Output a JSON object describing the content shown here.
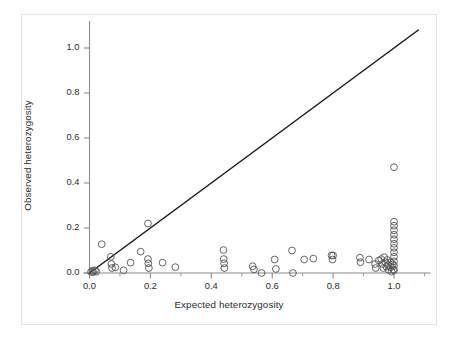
{
  "chart_data": {
    "type": "scatter",
    "title": "",
    "xlabel": "Expected heterozygosity",
    "ylabel": "Observed heterozygosity",
    "xlim": [
      -0.04,
      1.12
    ],
    "ylim": [
      -0.035,
      1.12
    ],
    "xticks": [
      0.0,
      0.2,
      0.4,
      0.6,
      0.8,
      1.0
    ],
    "xticklabels": [
      "0.0",
      "0.2",
      "0.4",
      "0.6",
      "0.8",
      "1.0"
    ],
    "yticks": [
      0.0,
      0.2,
      0.4,
      0.6,
      0.8,
      1.0
    ],
    "yticklabels": [
      "0.0",
      "0.2",
      "0.4",
      "0.6",
      "0.8",
      "1.0"
    ],
    "minor_xticks": [
      0.1,
      0.3,
      0.5,
      0.7,
      0.9,
      1.1
    ],
    "grid": false,
    "legend": null,
    "marker": {
      "shape": "open-circle",
      "radius": 3.4,
      "edge_color": "#555555",
      "face_color": "none",
      "edge_width": 0.9
    },
    "reference_line": {
      "label": "y = x identity line",
      "x0": 0.0,
      "y0": 0.0,
      "x1": 1.08,
      "y1": 1.08,
      "color": "#1a1a1a",
      "width": 1.5
    },
    "axis_color": "#8c8c8c",
    "series": [
      {
        "name": "loci",
        "points": [
          [
            0.005,
            0.005
          ],
          [
            0.01,
            0.01
          ],
          [
            0.012,
            0.004
          ],
          [
            0.018,
            0.012
          ],
          [
            0.022,
            0.006
          ],
          [
            0.04,
            0.128
          ],
          [
            0.07,
            0.072
          ],
          [
            0.072,
            0.04
          ],
          [
            0.074,
            0.022
          ],
          [
            0.085,
            0.025
          ],
          [
            0.112,
            0.012
          ],
          [
            0.135,
            0.046
          ],
          [
            0.168,
            0.095
          ],
          [
            0.192,
            0.22
          ],
          [
            0.192,
            0.062
          ],
          [
            0.193,
            0.043
          ],
          [
            0.195,
            0.022
          ],
          [
            0.24,
            0.046
          ],
          [
            0.282,
            0.026
          ],
          [
            0.44,
            0.102
          ],
          [
            0.441,
            0.062
          ],
          [
            0.442,
            0.043
          ],
          [
            0.443,
            0.022
          ],
          [
            0.536,
            0.03
          ],
          [
            0.54,
            0.016
          ],
          [
            0.565,
            0.0
          ],
          [
            0.608,
            0.06
          ],
          [
            0.612,
            0.018
          ],
          [
            0.665,
            0.1
          ],
          [
            0.668,
            0.0
          ],
          [
            0.705,
            0.06
          ],
          [
            0.735,
            0.064
          ],
          [
            0.795,
            0.078
          ],
          [
            0.798,
            0.06
          ],
          [
            0.8,
            0.078
          ],
          [
            0.888,
            0.068
          ],
          [
            0.89,
            0.048
          ],
          [
            0.918,
            0.06
          ],
          [
            0.938,
            0.04
          ],
          [
            0.94,
            0.022
          ],
          [
            0.95,
            0.055
          ],
          [
            0.958,
            0.062
          ],
          [
            0.962,
            0.04
          ],
          [
            0.965,
            0.022
          ],
          [
            0.968,
            0.07
          ],
          [
            0.972,
            0.048
          ],
          [
            0.975,
            0.028
          ],
          [
            0.978,
            0.058
          ],
          [
            0.98,
            0.036
          ],
          [
            0.982,
            0.014
          ],
          [
            0.988,
            0.048
          ],
          [
            0.99,
            0.026
          ],
          [
            0.992,
            0.006
          ],
          [
            0.996,
            0.038
          ],
          [
            0.998,
            0.016
          ],
          [
            1.0,
            0.47
          ],
          [
            1.0,
            0.228
          ],
          [
            1.0,
            0.21
          ],
          [
            1.0,
            0.19
          ],
          [
            1.0,
            0.17
          ],
          [
            1.0,
            0.15
          ],
          [
            1.0,
            0.13
          ],
          [
            1.0,
            0.112
          ],
          [
            1.0,
            0.092
          ],
          [
            1.0,
            0.072
          ],
          [
            1.0,
            0.052
          ],
          [
            1.0,
            0.032
          ],
          [
            1.0,
            0.012
          ]
        ]
      }
    ]
  }
}
